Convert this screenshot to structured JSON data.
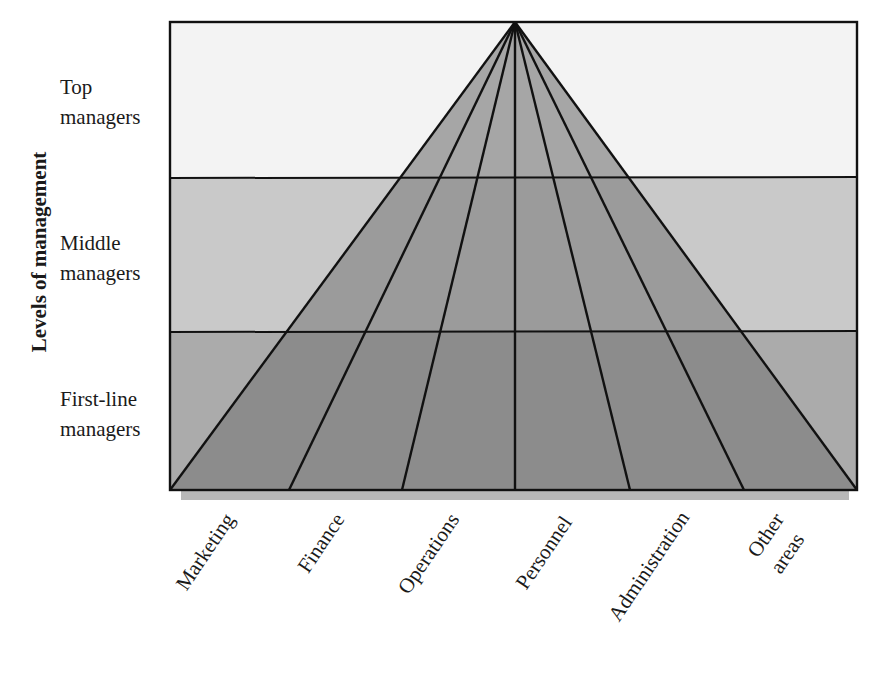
{
  "diagram": {
    "axis_title": "Levels of management",
    "levels": [
      {
        "line1": "Top",
        "line2": "managers"
      },
      {
        "line1": "Middle",
        "line2": "managers"
      },
      {
        "line1": "First-line",
        "line2": "managers"
      }
    ],
    "areas": [
      {
        "label": "Marketing"
      },
      {
        "label": "Finance"
      },
      {
        "label": "Operations"
      },
      {
        "label": "Personnel"
      },
      {
        "label": "Administration"
      },
      {
        "label": "Other",
        "label2": "areas"
      }
    ],
    "colors": {
      "band_top": "#f3f3f3",
      "band_middle": "#c9c9c9",
      "band_bottom": "#ababab",
      "triangle_top": "#a6a6a6",
      "triangle_middle": "#9b9b9b",
      "triangle_bottom": "#8c8c8c",
      "shadow": "#b8b8b8",
      "line": "#111111"
    }
  }
}
